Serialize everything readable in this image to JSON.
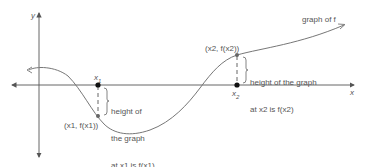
{
  "diagram": {
    "axes": {
      "x_label": "x",
      "y_label": "y"
    },
    "curve_label": "graph of f",
    "point1": {
      "tick_label": "x1",
      "tick_base": "x",
      "tick_sub": "1",
      "point_label": "(x1, f(x1))",
      "annotation_lines": [
        "height of",
        "the graph",
        "at x1 is f(x1)"
      ]
    },
    "point2": {
      "tick_label": "x2",
      "tick_base": "x",
      "tick_sub": "2",
      "point_label": "(x2, f(x2))",
      "annotation_lines": [
        "height of the graph",
        "at x2 is f(x2)"
      ]
    },
    "colors": {
      "axis": "#555555",
      "curve": "#777777",
      "point": "#111111",
      "text": "#555555"
    }
  }
}
